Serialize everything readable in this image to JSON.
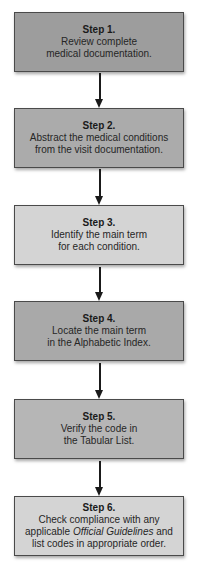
{
  "flowchart": {
    "steps": [
      {
        "title": "Step 1.",
        "lines": [
          "Review complete",
          "medical documentation."
        ],
        "fill": "#9d9d9d"
      },
      {
        "title": "Step 2.",
        "lines": [
          "Abstract the medical conditions",
          "from the visit documentation."
        ],
        "fill": "#ababab"
      },
      {
        "title": "Step 3.",
        "lines": [
          "Identify the main term",
          "for each condition."
        ],
        "fill": "#d4d4d4"
      },
      {
        "title": "Step 4.",
        "lines": [
          "Locate the main term",
          "in the Alphabetic Index."
        ],
        "fill": "#a9a9a9"
      },
      {
        "title": "Step 5.",
        "lines": [
          "Verify the code in",
          "the Tabular List."
        ],
        "fill": "#b6b6b6"
      },
      {
        "title": "Step 6.",
        "lines": [
          "Check compliance with any"
        ],
        "line2_prefix": "applicable ",
        "line2_italic": "Official Guidelines",
        "line2_suffix": " and",
        "line3": "list codes in appropriate order.",
        "fill": "#d4d4d4"
      }
    ],
    "arrow_color": "#1a1a1a",
    "border_color": "#4a4a4a"
  }
}
